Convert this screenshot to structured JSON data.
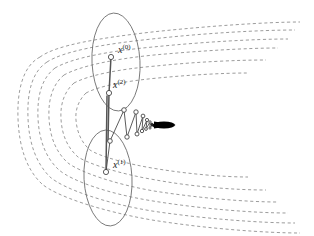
{
  "figure": {
    "type": "optimization-trajectory-diagram",
    "background_color": "#ffffff"
  },
  "labels": {
    "x0": {
      "base": "x",
      "superscript": "(0)",
      "full": "x(0)",
      "x": 118,
      "y": 45
    },
    "x2": {
      "base": "x",
      "superscript": "(2)",
      "full": "x(2)",
      "x": 113,
      "y": 80
    },
    "x1": {
      "base": "x",
      "superscript": "(1)",
      "full": "x(1)",
      "x": 113,
      "y": 160
    }
  },
  "colors": {
    "contour": "#8a8a8a",
    "ellipse": "#6f6f6f",
    "path": "#4a4a4a",
    "marker_fill": "#ffffff",
    "marker_stroke": "#3d3d3d",
    "optimum": "#000000",
    "label_text": "#1a1a1a"
  },
  "contours": {
    "count": 6,
    "style": "dashed",
    "shape": "nested-crescent-valley",
    "dash_pattern": "3.1 2.6",
    "stroke_width": 0.85,
    "paths": [
      "M 40 57 C 23 66 17 90 18 118 C 19 148 27 170 42 184 C 56 196 100 211 152 220 C 208 229 268 233 300 233",
      "M 47 62 C 32 72 27 92 28 118 C 29 145 37 164 50 177 C 64 189 104 203 152 211 C 205 219 262 223 295 223",
      "M 55 68 C 42 78 37 95 38 118 C 39 142 47 159 59 170 C 72 181 109 194 153 201 C 202 209 255 213 288 213",
      "M 64 75 C 53 84 48 99 49 118 C 50 139 57 153 68 163 C 80 172 114 184 154 191 C 198 198 246 202 278 202",
      "M 74 83 C 65 91 60 103 61 119 C 62 136 68 148 78 157 C 89 164 120 174 156 180 C 194 187 236 190 266 190",
      "M 86 93 C 79 100 75 109 76 120 C 77 133 82 143 90 150 C 99 156 126 164 158 169 C 189 174 223 177 248 177"
    ],
    "upper_branch_paths": [
      "M 40 57 C 56 45 100 38 152 32 C 208 26 268 22 300 22",
      "M 47 62 C 64 51 104 44 152 39 C 205 33 262 30 295 30",
      "M 55 68 C 72 58 109 51 153 47 C 202 42 255 39 288 39",
      "M 64 75 C 80 66 114 59 154 55 C 198 51 246 48 278 48",
      "M 74 83 C 89 75 120 69 156 66 C 194 62 236 60 266 60",
      "M 86 93 C 99 86 126 81 158 78 C 189 75 223 73 248 73"
    ]
  },
  "ellipses": [
    {
      "name": "upper-search-ellipse",
      "cx": 116,
      "cy": 62,
      "rx": 24,
      "ry": 49,
      "rotation": -3
    },
    {
      "name": "lower-search-ellipse",
      "cx": 108,
      "cy": 178,
      "rx": 24,
      "ry": 48,
      "rotation": -3
    }
  ],
  "iterates": [
    {
      "name": "x0",
      "x": 111,
      "y": 57,
      "r": 2.6,
      "labelled": true
    },
    {
      "name": "x2",
      "x": 109,
      "y": 93,
      "r": 2.6,
      "labelled": true
    },
    {
      "name": "x1",
      "x": 106,
      "y": 172,
      "r": 2.6,
      "labelled": true
    },
    {
      "name": "x3",
      "x": 110,
      "y": 141,
      "r": 2.3,
      "labelled": false
    },
    {
      "name": "x4",
      "x": 124,
      "y": 110,
      "r": 2.3,
      "labelled": false
    },
    {
      "name": "x5",
      "x": 127,
      "y": 137,
      "r": 2.2,
      "labelled": false
    },
    {
      "name": "x6",
      "x": 136,
      "y": 112,
      "r": 2.2,
      "labelled": false
    },
    {
      "name": "x7",
      "x": 137,
      "y": 134,
      "r": 2.0,
      "labelled": false
    },
    {
      "name": "x8",
      "x": 143,
      "y": 116,
      "r": 1.9,
      "labelled": false
    },
    {
      "name": "x9",
      "x": 142,
      "y": 131,
      "r": 1.7,
      "labelled": false
    },
    {
      "name": "x10",
      "x": 147,
      "y": 120,
      "r": 1.6,
      "labelled": false
    },
    {
      "name": "x11",
      "x": 146,
      "y": 129,
      "r": 1.4,
      "labelled": false
    },
    {
      "name": "x12",
      "x": 150,
      "y": 122,
      "r": 1.2,
      "labelled": false
    },
    {
      "name": "x13",
      "x": 150,
      "y": 128,
      "r": 1.1,
      "labelled": false
    }
  ],
  "trajectory": {
    "description": "zigzag descent path connecting successive iterates toward the optimum",
    "vertical_segments": [
      "M 111 57 L 109 93",
      "M 109 93 L 108 141",
      "M 107 96 L 106 172"
    ],
    "zigzag_points": "106,172 110,141 124,110 127,137 136,112 137,134 143,116 142,131 147,120 146,129 150,122 150,128 153,124 153,127 156,125"
  },
  "optimum": {
    "name": "convergence-point",
    "x": 160,
    "y": 125,
    "blob_width": 22,
    "blob_height": 7,
    "color": "#000000"
  }
}
